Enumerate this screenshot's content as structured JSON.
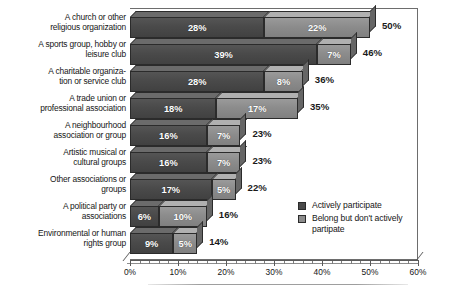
{
  "chart_data": {
    "type": "bar",
    "orientation": "horizontal",
    "stacked": true,
    "title": "",
    "subtitle": "",
    "xlabel": "",
    "ylabel": "",
    "xlim": [
      0,
      60
    ],
    "grid": false,
    "legend_position": "inside-bottom-right",
    "categories": [
      "A church or other\nreligious organization",
      "A sports group, hobby or\nleisure club",
      "A charitable organiza-\ntion or service club",
      "A trade union or\nprofessional association",
      "A neighbourhood\nassociation or group",
      "Artistic musical or\ncultural groups",
      "Other associations or\ngroups",
      "A political party or\nassociations",
      "Environmental or human\nrights group"
    ],
    "series": [
      {
        "name": "Actively participate",
        "color": "#4a4a4a",
        "values": [
          28,
          39,
          28,
          18,
          16,
          16,
          17,
          6,
          9
        ],
        "labels": [
          "28%",
          "39%",
          "28%",
          "18%",
          "16%",
          "16%",
          "17%",
          "6%",
          "9%"
        ]
      },
      {
        "name": "Belong but don't actively partipate",
        "color": "#8c8c8c",
        "values": [
          22,
          7,
          8,
          17,
          7,
          7,
          5,
          10,
          5
        ],
        "labels": [
          "22%",
          "7%",
          "8%",
          "17%",
          "7%",
          "7%",
          "5%",
          "10%",
          "5%"
        ]
      }
    ],
    "totals": [
      50,
      46,
      36,
      35,
      23,
      23,
      22,
      16,
      14
    ],
    "total_labels": [
      "50%",
      "46%",
      "36%",
      "35%",
      "23%",
      "23%",
      "22%",
      "16%",
      "14%"
    ],
    "xticks": [
      0,
      10,
      20,
      30,
      40,
      50,
      60
    ],
    "xtick_labels": [
      "0%",
      "10%",
      "20%",
      "30%",
      "40%",
      "50%",
      "60%"
    ],
    "minor_tick_step": 2
  },
  "legend": {
    "items": [
      {
        "label": "Actively participate",
        "color": "#4a4a4a"
      },
      {
        "label": "Belong but don't actively\npartipate",
        "color": "#8c8c8c"
      }
    ]
  }
}
